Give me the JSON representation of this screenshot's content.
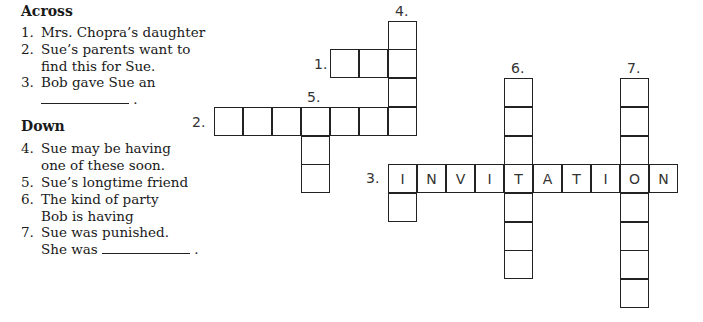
{
  "clues": {
    "across_heading": "Across",
    "down_heading": "Down",
    "across": [
      {
        "num": "1.",
        "text": "Mrs. Chopra’s daughter"
      },
      {
        "num": "2.",
        "text": "Sue’s parents want to\nfind this for Sue."
      },
      {
        "num": "3.",
        "text": "Bob gave Sue an",
        "tail": "."
      }
    ],
    "down": [
      {
        "num": "4.",
        "text": "Sue may be having\none of these soon."
      },
      {
        "num": "5.",
        "text": "Sue’s longtime friend"
      },
      {
        "num": "6.",
        "text": "The kind of party\nBob is having"
      },
      {
        "num": "7.",
        "text": "Sue was punished.",
        "text2": "She was",
        "tail": "."
      }
    ]
  },
  "grid": {
    "labels": {
      "l1": "1.",
      "l2": "2.",
      "l3": "3.",
      "l4": "4.",
      "l5": "5.",
      "l6": "6.",
      "l7": "7."
    },
    "answer_3_across": [
      "I",
      "N",
      "V",
      "I",
      "T",
      "A",
      "T",
      "I",
      "O",
      "N"
    ]
  }
}
